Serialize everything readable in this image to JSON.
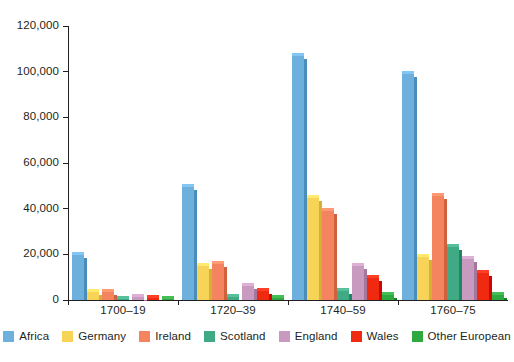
{
  "chart_data": {
    "type": "bar",
    "title": "",
    "subtitle": "",
    "xlabel": "",
    "ylabel": "",
    "categories": [
      "1700–19",
      "1720–39",
      "1740–59",
      "1760–75"
    ],
    "ylim": [
      0,
      120000
    ],
    "ytick_values": [
      0,
      20000,
      40000,
      60000,
      80000,
      100000,
      120000
    ],
    "ytick_labels": [
      "0",
      "20,000",
      "40,000",
      "60,000",
      "80,000",
      "100,000",
      "120,000"
    ],
    "grid": false,
    "legend_position": "bottom",
    "series": [
      {
        "name": "Africa",
        "color": "#6EB0DD",
        "values": [
          19500,
          49500,
          106800,
          99000
        ]
      },
      {
        "name": "Germany",
        "color": "#F7D358",
        "values": [
          3300,
          14800,
          44800,
          18800
        ]
      },
      {
        "name": "Ireland",
        "color": "#F4845F",
        "values": [
          3700,
          15800,
          39000,
          45500
        ]
      },
      {
        "name": "Scotland",
        "color": "#3FAA84",
        "values": [
          300,
          1300,
          4000,
          23000
        ]
      },
      {
        "name": "England",
        "color": "#C99AC0",
        "values": [
          1400,
          6100,
          15000,
          18000
        ]
      },
      {
        "name": "Wales",
        "color": "#F02A11",
        "values": [
          800,
          3800,
          9800,
          12000
        ]
      },
      {
        "name": "Other European",
        "color": "#2EA83F",
        "values": [
          200,
          700,
          2200,
          2000
        ]
      }
    ]
  }
}
